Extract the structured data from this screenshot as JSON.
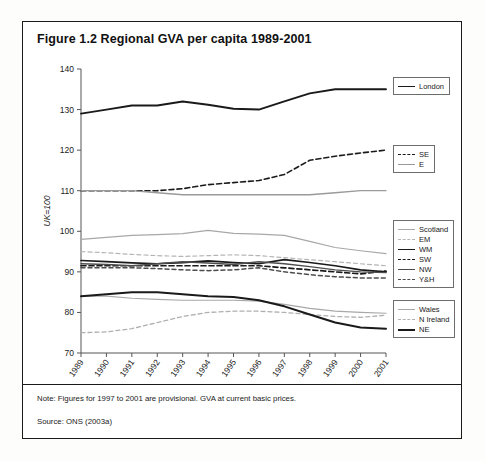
{
  "figure": {
    "title": "Figure 1.2 Regional GVA per capita 1989-2001",
    "note": "Note: Figures for 1997 to 2001 are provisional. GVA at current basic prices.",
    "source": "Source: ONS (2003a)"
  },
  "legends": [
    {
      "name": "legend-london",
      "entries": [
        {
          "label": "London",
          "color": "#1a1a1a",
          "width": 1.9,
          "dash": "none"
        }
      ]
    },
    {
      "name": "legend-se-e",
      "entries": [
        {
          "label": "SE",
          "color": "#1a1a1a",
          "width": 1.6,
          "dash": "dashed"
        },
        {
          "label": "E",
          "color": "#9a9a9a",
          "width": 1.3,
          "dash": "none"
        }
      ]
    },
    {
      "name": "legend-mid",
      "entries": [
        {
          "label": "Scotland",
          "color": "#a8a8a8",
          "width": 1.2,
          "dash": "none"
        },
        {
          "label": "EM",
          "color": "#b5b5b5",
          "width": 1.2,
          "dash": "dashed"
        },
        {
          "label": "WM",
          "color": "#1a1a1a",
          "width": 1.7,
          "dash": "none"
        },
        {
          "label": "SW",
          "color": "#1a1a1a",
          "width": 1.7,
          "dash": "dashed"
        },
        {
          "label": "NW",
          "color": "#4d4d4d",
          "width": 1.4,
          "dash": "none"
        },
        {
          "label": "Y&H",
          "color": "#4d4d4d",
          "width": 1.5,
          "dash": "dashed"
        }
      ]
    },
    {
      "name": "legend-bottom",
      "entries": [
        {
          "label": "Wales",
          "color": "#a8a8a8",
          "width": 1.2,
          "dash": "none"
        },
        {
          "label": "N Ireland",
          "color": "#b0b0b0",
          "width": 1.3,
          "dash": "dashed"
        },
        {
          "label": "NE",
          "color": "#1a1a1a",
          "width": 2.0,
          "dash": "none"
        }
      ]
    }
  ],
  "chart_data": {
    "type": "line",
    "title": "Figure 1.2 Regional GVA per capita 1989-2001",
    "xlabel": "",
    "ylabel": "UK=100",
    "ylim": [
      70,
      140
    ],
    "yticks": [
      70,
      80,
      90,
      100,
      110,
      120,
      130,
      140
    ],
    "grid": false,
    "legend_position": "right",
    "x": [
      1989,
      1990,
      1991,
      1992,
      1993,
      1994,
      1995,
      1996,
      1997,
      1998,
      1999,
      2000,
      2001
    ],
    "categories": [
      "1989",
      "1990",
      "1991",
      "1992",
      "1993",
      "1994",
      "1995",
      "1996",
      "1997",
      "1998",
      "1999",
      "2000",
      "2001"
    ],
    "series": [
      {
        "name": "London",
        "color": "#1a1a1a",
        "width": 1.9,
        "dash": "none",
        "values": [
          129.0,
          130.0,
          131.0,
          131.0,
          132.0,
          131.2,
          130.2,
          130.0,
          132.0,
          134.0,
          135.0,
          135.0,
          135.0
        ]
      },
      {
        "name": "SE",
        "color": "#1a1a1a",
        "width": 1.6,
        "dash": "dashed",
        "values": [
          110.0,
          110.0,
          110.0,
          110.0,
          110.5,
          111.5,
          112.0,
          112.5,
          114.0,
          117.5,
          118.5,
          119.3,
          120.0
        ]
      },
      {
        "name": "E",
        "color": "#9a9a9a",
        "width": 1.3,
        "dash": "none",
        "values": [
          110.0,
          110.0,
          110.0,
          109.5,
          109.0,
          109.0,
          109.0,
          109.0,
          109.0,
          109.0,
          109.5,
          110.0,
          110.0
        ]
      },
      {
        "name": "Scotland",
        "color": "#a8a8a8",
        "width": 1.2,
        "dash": "none",
        "values": [
          98.0,
          98.5,
          99.0,
          99.2,
          99.4,
          100.2,
          99.5,
          99.3,
          99.0,
          97.5,
          96.0,
          95.2,
          94.5
        ]
      },
      {
        "name": "EM",
        "color": "#b5b5b5",
        "width": 1.2,
        "dash": "dashed",
        "values": [
          95.0,
          94.7,
          94.3,
          94.0,
          93.8,
          94.0,
          94.2,
          94.0,
          93.5,
          93.0,
          92.5,
          92.0,
          91.5
        ]
      },
      {
        "name": "WM",
        "color": "#1a1a1a",
        "width": 1.7,
        "dash": "none",
        "values": [
          92.8,
          92.5,
          92.2,
          92.0,
          92.3,
          92.7,
          92.3,
          92.0,
          93.0,
          92.3,
          91.5,
          90.5,
          90.0
        ]
      },
      {
        "name": "SW",
        "color": "#1a1a1a",
        "width": 1.7,
        "dash": "dashed",
        "values": [
          91.5,
          91.5,
          91.5,
          91.5,
          91.5,
          91.5,
          91.5,
          91.5,
          91.0,
          90.5,
          90.0,
          89.5,
          90.2
        ]
      },
      {
        "name": "NW",
        "color": "#4d4d4d",
        "width": 1.4,
        "dash": "none",
        "values": [
          92.0,
          91.8,
          91.5,
          92.0,
          92.5,
          92.2,
          91.8,
          92.5,
          92.0,
          91.3,
          90.5,
          90.0,
          89.8
        ]
      },
      {
        "name": "Y&H",
        "color": "#4d4d4d",
        "width": 1.5,
        "dash": "dashed",
        "values": [
          91.0,
          91.0,
          91.0,
          90.8,
          90.5,
          90.3,
          90.5,
          91.0,
          90.0,
          89.3,
          88.8,
          88.5,
          88.5
        ]
      },
      {
        "name": "Wales",
        "color": "#a8a8a8",
        "width": 1.2,
        "dash": "none",
        "values": [
          84.0,
          84.0,
          83.5,
          83.2,
          83.0,
          83.0,
          83.0,
          82.8,
          82.0,
          81.0,
          80.3,
          80.0,
          79.8
        ]
      },
      {
        "name": "N Ireland",
        "color": "#b0b0b0",
        "width": 1.3,
        "dash": "dashed",
        "values": [
          75.0,
          75.2,
          76.0,
          77.5,
          79.0,
          80.0,
          80.3,
          80.3,
          80.0,
          79.5,
          79.0,
          78.8,
          79.3
        ]
      },
      {
        "name": "NE",
        "color": "#1a1a1a",
        "width": 2.0,
        "dash": "none",
        "values": [
          84.0,
          84.5,
          85.0,
          85.0,
          84.5,
          84.0,
          83.8,
          83.0,
          81.5,
          79.5,
          77.5,
          76.3,
          76.0
        ]
      }
    ]
  }
}
